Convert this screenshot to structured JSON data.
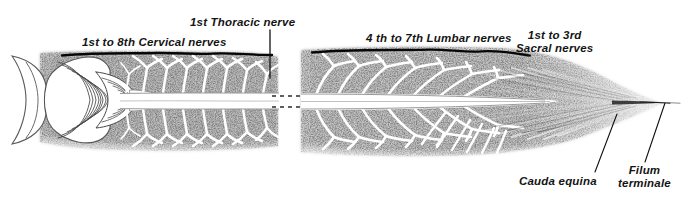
{
  "figure": {
    "width": 684,
    "height": 200,
    "background_color": "#ffffff",
    "ink_color": "#141414"
  },
  "labels": {
    "cervical": "1st to 8th Cervical nerves",
    "thoracic": "1st Thoracic nerve",
    "lumbar": "4 th to 7th Lumbar nerves",
    "sacral_line1": "1st to 3rd",
    "sacral_line2": "Sacral nerves",
    "cauda_equina": "Cauda equina",
    "filum_line1": "Filum",
    "filum_line2": "terminale"
  },
  "structures": {
    "brain_end": "cerebellum-brainstem",
    "cord": "spinal-cord",
    "break_gap": "illustration-break",
    "cauda_equina_fan": "cauda-equina",
    "filum_terminale_tip": "filum-terminale"
  },
  "leader_lines": [
    {
      "name": "thoracic-leader",
      "x1": 270,
      "y1": 30,
      "x2": 270,
      "y2": 78
    },
    {
      "name": "cauda-equina-leader",
      "x1": 617,
      "y1": 114,
      "x2": 595,
      "y2": 172
    },
    {
      "name": "filum-terminale-leader",
      "x1": 665,
      "y1": 103,
      "x2": 645,
      "y2": 162
    }
  ]
}
